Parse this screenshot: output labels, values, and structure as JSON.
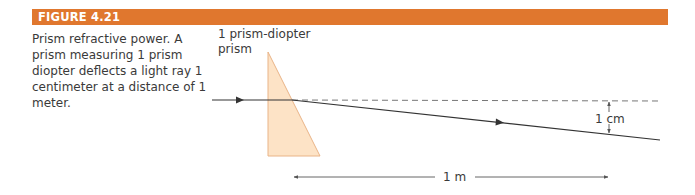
{
  "figure": {
    "label": "FIGURE 4.21",
    "header_color": "#e0772e",
    "caption": "Prism refractive power. A prism measuring 1 prism diopter deflects a light ray 1 centimeter at a distance of 1 meter."
  },
  "diagram": {
    "prism_label_line1": "1 prism-diopter",
    "prism_label_line2": "prism",
    "deflection_label": "1 cm",
    "distance_label": "1 m",
    "prism_fill": "#fde3c6",
    "prism_stroke": "#e9b487"
  }
}
